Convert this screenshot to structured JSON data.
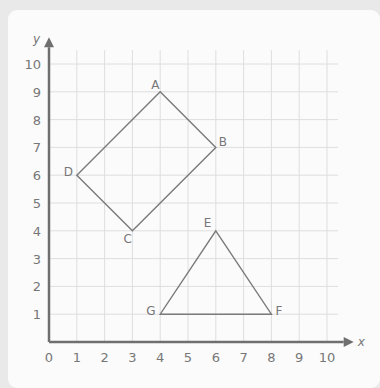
{
  "chart_data": {
    "type": "diagram",
    "title": "",
    "xlabel": "x",
    "ylabel": "y",
    "xlim": [
      0,
      10
    ],
    "ylim": [
      0,
      10
    ],
    "x_ticks": [
      "0",
      "1",
      "2",
      "3",
      "4",
      "5",
      "6",
      "7",
      "8",
      "9",
      "10"
    ],
    "y_ticks": [
      "1",
      "2",
      "3",
      "4",
      "5",
      "6",
      "7",
      "8",
      "9",
      "10"
    ],
    "grid": true,
    "shapes": [
      {
        "name": "quadrilateral ABCD",
        "points": [
          {
            "label": "A",
            "x": 4,
            "y": 9
          },
          {
            "label": "B",
            "x": 6,
            "y": 7
          },
          {
            "label": "C",
            "x": 3,
            "y": 4
          },
          {
            "label": "D",
            "x": 1,
            "y": 6
          }
        ]
      },
      {
        "name": "triangle EFG",
        "points": [
          {
            "label": "E",
            "x": 6,
            "y": 4
          },
          {
            "label": "F",
            "x": 8,
            "y": 1
          },
          {
            "label": "G",
            "x": 4,
            "y": 1
          }
        ]
      }
    ]
  },
  "axes": {
    "x_label": "x",
    "y_label": "y"
  },
  "colors": {
    "line": "#7a7a7a",
    "grid": "#dedede",
    "axis": "#6f6f6f",
    "text": "#777777"
  }
}
